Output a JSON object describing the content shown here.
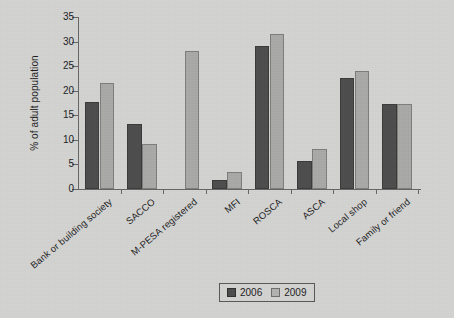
{
  "chart_data": {
    "type": "bar",
    "title": "",
    "subtitle": "",
    "xlabel": "",
    "ylabel": "% of adult population",
    "ylim": [
      0,
      35
    ],
    "y_ticks": [
      0,
      5,
      10,
      15,
      20,
      25,
      30,
      35
    ],
    "grid": false,
    "legend_position": "bottom-center",
    "categories": [
      "Bank or building society",
      "SACCO",
      "M-PESA registered",
      "MFI",
      "ROSCA",
      "ASCA",
      "Local shop",
      "Family or friend"
    ],
    "series": [
      {
        "name": "2006",
        "color": "#4d4d4d",
        "values": [
          17.8,
          13.2,
          null,
          1.9,
          29.2,
          5.8,
          22.6,
          17.2
        ]
      },
      {
        "name": "2009",
        "color": "#a9a9a8",
        "values": [
          21.5,
          9.2,
          28.0,
          3.4,
          31.5,
          8.1,
          24.1,
          17.2
        ]
      }
    ]
  },
  "legend": {
    "items": [
      {
        "label": "2006",
        "swatch": "s2006"
      },
      {
        "label": "2009",
        "swatch": "s2009"
      }
    ]
  },
  "colors": {
    "background": "#d3d3d2",
    "axis": "#666666",
    "text": "#1c1c1c",
    "series_2006": "#4d4d4d",
    "series_2009": "#a9a9a8"
  }
}
